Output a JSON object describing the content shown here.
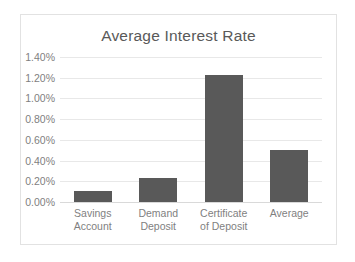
{
  "chart_data": {
    "type": "bar",
    "title": "Average Interest Rate",
    "xlabel": "",
    "ylabel": "",
    "categories": [
      "Savings Account",
      "Demand Deposit",
      "Certificate of Deposit",
      "Average"
    ],
    "category_lines": [
      [
        "Savings",
        "Account"
      ],
      [
        "Demand",
        "Deposit"
      ],
      [
        "Certificate",
        "of Deposit"
      ],
      [
        "Average",
        ""
      ]
    ],
    "values": [
      0.105,
      0.23,
      1.23,
      0.5
    ],
    "value_labels": [
      "0.105%",
      "0.23%",
      "1.23%",
      "0.50%"
    ],
    "ylim": [
      0,
      1.4
    ],
    "ytick_values": [
      1.4,
      1.2,
      1.0,
      0.8,
      0.6,
      0.4,
      0.2,
      0.0
    ],
    "ytick_labels": [
      "1.40%",
      "1.20%",
      "1.00%",
      "0.80%",
      "0.60%",
      "0.40%",
      "0.20%",
      "0.00%"
    ],
    "grid": true,
    "grid_axis": "y",
    "legend": false,
    "bar_color": "#595959",
    "gridline_color": "#e8e8e8",
    "text_color": "#7f7f7f",
    "title_color": "#595959",
    "border_color": "#e2e2e2",
    "background_color": "#ffffff"
  }
}
